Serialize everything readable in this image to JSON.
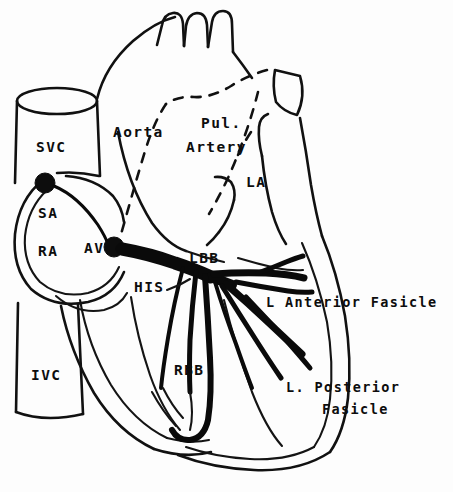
{
  "figure": {
    "style": "hand-drawn line diagram",
    "background_color": "#fdfdfd",
    "ink_color": "#0d0d0d"
  },
  "labels": {
    "svc": "SVC",
    "ivc": "IVC",
    "sa": "SA",
    "ra": "RA",
    "av": "AV",
    "aorta": "Aorta",
    "pul_line1": "Pul.",
    "pul_line2": "Artery",
    "la": "LA",
    "his": "HIS",
    "lbb": "LBB",
    "rbb": "RBB",
    "l_anterior_fasicle": "L Anterior Fasicle",
    "l_posterior_line1": "L. Posterior",
    "l_posterior_line2": "Fasicle"
  },
  "structures": {
    "sa_node": "sinoatrial-node",
    "av_node": "atrioventricular-node",
    "his_bundle": "bundle-of-his",
    "right_bundle_branch": "right-bundle-branch",
    "left_bundle_branch": "left-bundle-branch",
    "left_anterior_fascicle": "left-anterior-fascicle",
    "left_posterior_fascicle": "left-posterior-fascicle"
  }
}
